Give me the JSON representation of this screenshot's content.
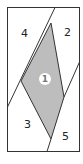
{
  "diagram": {
    "regions": [
      {
        "id": "1",
        "label": "1",
        "fill": "#bdbdbd",
        "highlighted": true
      },
      {
        "id": "2",
        "label": "2"
      },
      {
        "id": "3",
        "label": "3"
      },
      {
        "id": "4",
        "label": "4"
      },
      {
        "id": "5",
        "label": "5"
      }
    ],
    "colors": {
      "stroke": "#333333",
      "shaded": "#bdbdbd",
      "background": "#ffffff"
    }
  }
}
